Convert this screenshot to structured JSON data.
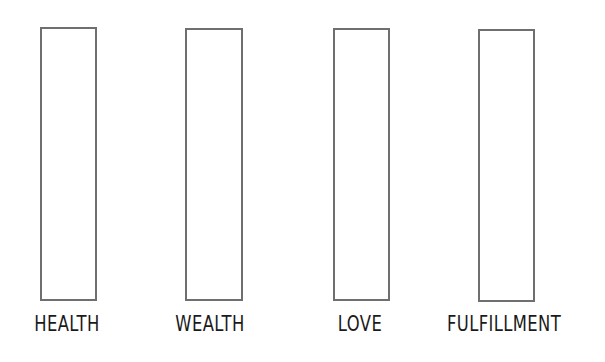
{
  "diagram": {
    "bars": [
      {
        "label": "HEALTH",
        "left": 40,
        "top": 27,
        "width": 57,
        "height": 274,
        "label_center": 67
      },
      {
        "label": "WEALTH",
        "left": 185,
        "top": 28,
        "width": 58,
        "height": 273,
        "label_center": 210
      },
      {
        "label": "LOVE",
        "left": 333,
        "top": 28,
        "width": 57,
        "height": 273,
        "label_center": 360
      },
      {
        "label": "FULFILLMENT",
        "left": 478,
        "top": 29,
        "width": 57,
        "height": 273,
        "label_center": 504
      }
    ],
    "border_color": "#6f6f6f",
    "label_color": "#1a1a1a"
  }
}
